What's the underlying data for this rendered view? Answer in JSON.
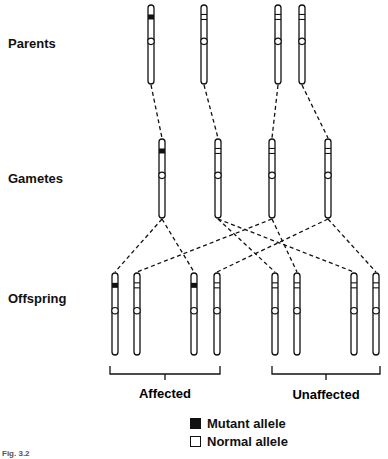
{
  "row_labels": {
    "parents": "Parents",
    "gametes": "Gametes",
    "offspring": "Offspring"
  },
  "groups": {
    "affected": "Affected",
    "unaffected": "Unaffected"
  },
  "legend": {
    "mutant": "Mutant allele",
    "normal": "Normal allele"
  },
  "caption": "Fig. 3.2",
  "colors": {
    "ink": "#111111",
    "background": "#ffffff"
  },
  "genetics": {
    "parents": [
      {
        "id": "P1",
        "allele": "mutant"
      },
      {
        "id": "P2",
        "allele": "normal"
      },
      {
        "id": "P3",
        "allele": "normal"
      },
      {
        "id": "P4",
        "allele": "normal"
      }
    ],
    "gametes": [
      {
        "id": "G1",
        "allele": "mutant",
        "from": "P1"
      },
      {
        "id": "G2",
        "allele": "normal",
        "from": "P2"
      },
      {
        "id": "G3",
        "allele": "normal",
        "from": "P3"
      },
      {
        "id": "G4",
        "allele": "normal",
        "from": "P4"
      }
    ],
    "offspring": [
      {
        "id": "O1",
        "allele": "mutant",
        "from": "G1",
        "group": "affected"
      },
      {
        "id": "O2",
        "allele": "normal",
        "from": "G3",
        "group": "affected"
      },
      {
        "id": "O3",
        "allele": "mutant",
        "from": "G1",
        "group": "affected"
      },
      {
        "id": "O4",
        "allele": "normal",
        "from": "G4",
        "group": "affected"
      },
      {
        "id": "O5",
        "allele": "normal",
        "from": "G2",
        "group": "unaffected"
      },
      {
        "id": "O6",
        "allele": "normal",
        "from": "G3",
        "group": "unaffected"
      },
      {
        "id": "O7",
        "allele": "normal",
        "from": "G2",
        "group": "unaffected"
      },
      {
        "id": "O8",
        "allele": "normal",
        "from": "G4",
        "group": "unaffected"
      }
    ]
  }
}
